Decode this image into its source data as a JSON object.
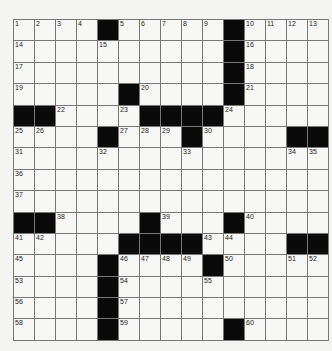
{
  "puzzle": {
    "rows": 15,
    "cols": 15,
    "grid": [
      [
        "1",
        "2",
        "3",
        "4",
        "#",
        "5",
        "6",
        "7",
        "8",
        "9",
        "#",
        "10",
        "11",
        "12",
        "13"
      ],
      [
        "14",
        "",
        "",
        "",
        "15",
        "",
        "",
        "",
        "",
        "",
        "#",
        "16",
        "",
        "",
        ""
      ],
      [
        "17",
        "",
        "",
        "",
        "",
        "",
        "",
        "",
        "",
        "",
        "#",
        "18",
        "",
        "",
        ""
      ],
      [
        "19",
        "",
        "",
        "",
        "",
        "#",
        "20",
        "",
        "",
        "",
        "#",
        "21",
        "",
        "",
        ""
      ],
      [
        "#",
        "#",
        "22",
        "",
        "",
        "23",
        "#",
        "#",
        "#",
        "#",
        "24",
        "",
        "",
        "",
        ""
      ],
      [
        "25",
        "26",
        "",
        "",
        "#",
        "27",
        "28",
        "29",
        "#",
        "30",
        "",
        "",
        "",
        "#",
        "#"
      ],
      [
        "31",
        "",
        "",
        "",
        "32",
        "",
        "",
        "",
        "33",
        "",
        "",
        "",
        "",
        "34",
        "35"
      ],
      [
        "36",
        "",
        "",
        "",
        "",
        "",
        "",
        "",
        "",
        "",
        "",
        "",
        "",
        "",
        ""
      ],
      [
        "37",
        "",
        "",
        "",
        "",
        "",
        "",
        "",
        "",
        "",
        "",
        "",
        "",
        "",
        ""
      ],
      [
        "#",
        "#",
        "38",
        "",
        "",
        "",
        "#",
        "39",
        "",
        "",
        "#",
        "40",
        "",
        "",
        ""
      ],
      [
        "41",
        "42",
        "",
        "",
        "",
        "#",
        "#",
        "#",
        "#",
        "43",
        "44",
        "",
        "",
        "#",
        "#"
      ],
      [
        "45",
        "",
        "",
        "",
        "#",
        "46",
        "47",
        "48",
        "49",
        "#",
        "50",
        "",
        "",
        "51",
        "52"
      ],
      [
        "53",
        "",
        "",
        "",
        "#",
        "54",
        "",
        "",
        "",
        "55",
        "",
        "",
        "",
        "",
        ""
      ],
      [
        "56",
        "",
        "",
        "",
        "#",
        "57",
        "",
        "",
        "",
        "",
        "",
        "",
        "",
        "",
        ""
      ],
      [
        "58",
        "",
        "",
        "",
        "#",
        "59",
        "",
        "",
        "",
        "",
        "#",
        "60",
        "",
        "",
        ""
      ]
    ]
  }
}
